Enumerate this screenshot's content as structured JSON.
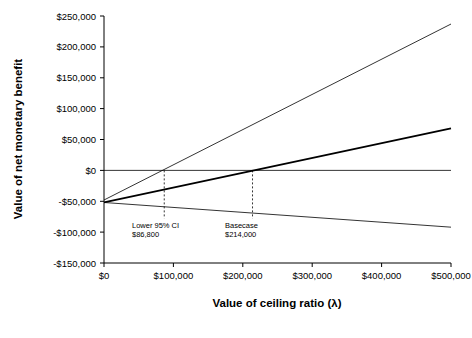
{
  "chart_data": {
    "type": "line",
    "title": "",
    "xlabel": "Value of ceiling ratio (λ)",
    "ylabel": "Value of net monetary benefit",
    "xlim": [
      0,
      500000
    ],
    "ylim": [
      -150000,
      250000
    ],
    "grid": false,
    "legend": "none",
    "xticks": [
      {
        "value": 0,
        "label": "$0"
      },
      {
        "value": 100000,
        "label": "$100,000"
      },
      {
        "value": 200000,
        "label": "$200,000"
      },
      {
        "value": 300000,
        "label": "$300,000"
      },
      {
        "value": 400000,
        "label": "$400,000"
      },
      {
        "value": 500000,
        "label": "$500,000"
      }
    ],
    "yticks": [
      {
        "value": 250000,
        "label": "$250,000"
      },
      {
        "value": 200000,
        "label": "$200,000"
      },
      {
        "value": 150000,
        "label": "$150,000"
      },
      {
        "value": 100000,
        "label": "$100,000"
      },
      {
        "value": 50000,
        "label": "$50,000"
      },
      {
        "value": 0,
        "label": "$0"
      },
      {
        "value": -50000,
        "label": "-$50,000"
      },
      {
        "value": -100000,
        "label": "-$100,000"
      },
      {
        "value": -150000,
        "label": "-$150,000"
      }
    ],
    "series": [
      {
        "name": "Upper 95% CI",
        "x": [
          0,
          500000
        ],
        "values": [
          -48000,
          237000
        ],
        "color": "#000000",
        "width": 0.8
      },
      {
        "name": "Basecase",
        "x": [
          0,
          500000
        ],
        "values": [
          -52000,
          68000
        ],
        "color": "#000000",
        "width": 1.8
      },
      {
        "name": "Lower 95% CI",
        "x": [
          0,
          500000
        ],
        "values": [
          -52000,
          -92000
        ],
        "color": "#000000",
        "width": 0.8
      },
      {
        "name": "Zero net benefit line",
        "x": [
          0,
          500000
        ],
        "values": [
          0,
          0
        ],
        "color": "#000000",
        "width": 0.8
      }
    ],
    "annotations": [
      {
        "name": "lower-95-ci",
        "label_line1": "Lower 95% CI",
        "label_line2": "$86,800",
        "x": 86800,
        "y_from": 0,
        "y_to": -78000
      },
      {
        "name": "basecase",
        "label_line1": "Basecase",
        "label_line2": "$214,000",
        "x": 214000,
        "y_from": 0,
        "y_to": -78000
      }
    ]
  }
}
